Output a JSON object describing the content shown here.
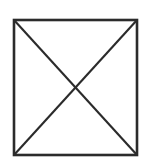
{
  "figure": {
    "canvas": {
      "width": 149,
      "height": 164,
      "background_color": "#ffffff"
    },
    "colors": {
      "stroke": "#2b2b2b",
      "fill": "#ffffff"
    },
    "shape": {
      "name": "square",
      "x": 14,
      "y": 20,
      "width": 123,
      "height": 135,
      "stroke_width": 2.6
    },
    "diagonals": [
      {
        "name": "diagonal-top-left-to-bottom-right",
        "x1": 14,
        "y1": 20,
        "x2": 137,
        "y2": 155,
        "stroke_width": 2.1
      },
      {
        "name": "diagonal-top-right-to-bottom-left",
        "x1": 137,
        "y1": 20,
        "x2": 14,
        "y2": 155,
        "stroke_width": 2.1
      }
    ],
    "vertices": {
      "top_left": "14,20",
      "top_right": "137,20",
      "bottom_left": "14,155",
      "bottom_right": "137,155",
      "center": "75.5,87.5"
    }
  }
}
